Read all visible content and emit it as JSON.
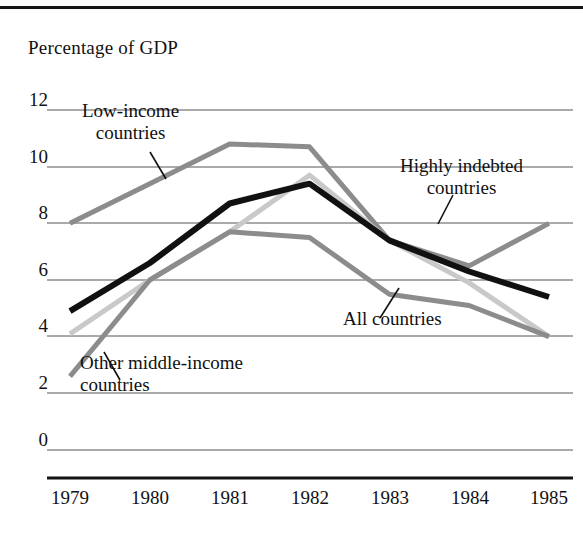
{
  "chart_data": {
    "type": "line",
    "title": "",
    "subtitle": "",
    "ylabel": "Percentage of GDP",
    "xlabel": "",
    "x": [
      1979,
      1980,
      1981,
      1982,
      1983,
      1984,
      1985
    ],
    "categories": [
      "1979",
      "1980",
      "1981",
      "1982",
      "1983",
      "1984",
      "1985"
    ],
    "ylim": [
      0,
      12
    ],
    "yticks": [
      0,
      2,
      4,
      6,
      8,
      10,
      12
    ],
    "ytick_labels": [
      "0",
      "2",
      "4",
      "6",
      "8",
      "10",
      "12"
    ],
    "grid": "horizontal",
    "legend": "annotations-on-plot",
    "series": [
      {
        "name": "Low-income countries",
        "color": "#8c8c8c",
        "width": 5,
        "values": [
          8.0,
          9.4,
          10.8,
          10.7,
          7.4,
          6.5,
          8.0
        ]
      },
      {
        "name": "Highly indebted countries",
        "color": "#c9c9c9",
        "width": 5,
        "values": [
          4.1,
          6.0,
          7.7,
          9.7,
          7.4,
          5.9,
          4.0
        ]
      },
      {
        "name": "All countries",
        "color": "#111111",
        "width": 6,
        "values": [
          4.9,
          6.6,
          8.7,
          9.4,
          7.4,
          6.3,
          5.4
        ]
      },
      {
        "name": "Other middle-income countries",
        "color": "#8c8c8c",
        "width": 5,
        "values": [
          2.6,
          6.0,
          7.7,
          7.5,
          5.5,
          5.1,
          4.0
        ]
      }
    ],
    "annotations": [
      {
        "label": "Low-income countries",
        "lines": [
          "Low-income",
          "countries"
        ]
      },
      {
        "label": "Highly indebted countries",
        "lines": [
          "Highly indebted",
          "countries"
        ]
      },
      {
        "label": "All countries",
        "lines": [
          "All countries"
        ]
      },
      {
        "label": "Other middle-income countries",
        "lines": [
          "Other middle-income",
          "countries"
        ]
      }
    ]
  },
  "axis": {
    "y_title": "Percentage of GDP",
    "y_ticks": [
      "12",
      "10",
      "8",
      "6",
      "4",
      "2",
      "0"
    ],
    "x_ticks": [
      "1979",
      "1980",
      "1981",
      "1982",
      "1983",
      "1984",
      "1985"
    ]
  },
  "callouts": {
    "low_income_l1": "Low-income",
    "low_income_l2": "countries",
    "highly_indebted_l1": "Highly indebted",
    "highly_indebted_l2": "countries",
    "all_countries": "All countries",
    "other_middle_l1": "Other middle-income",
    "other_middle_l2": "countries"
  }
}
